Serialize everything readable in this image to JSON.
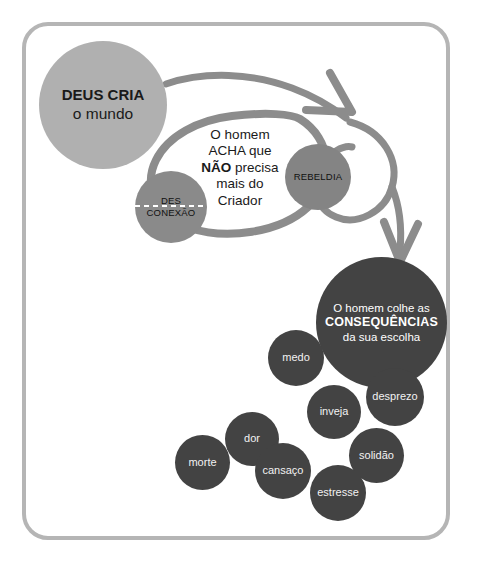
{
  "diagram": {
    "title_alt": "Ciclo: Deus cria o mundo, desconexao, rebeldia e consequencias",
    "frame_color": "#b5b5b5",
    "background": "#ffffff",
    "arrow_color": "#8c8c8c"
  },
  "nodes": {
    "deus": {
      "line1": "DEUS CRIA",
      "line2": "o mundo",
      "color": "#b0b0b0",
      "text_color": "#1a1a1a"
    },
    "desconexao": {
      "line1": "DES",
      "line2": "CONEXÃO",
      "color": "#8a8a8a",
      "text_color": "#111111"
    },
    "acha": {
      "line1": "O homem",
      "line2": "ACHA que",
      "line3_bold": "NÃO",
      "line3_rest": " precisa",
      "line4": "mais do",
      "line5": "Criador",
      "text_color": "#1a1a1a"
    },
    "rebeldia": {
      "label": "REBELDIA",
      "color": "#848484",
      "text_color": "#111111"
    },
    "consequencias": {
      "line1": "O homem colhe as",
      "line2_bold": "CONSEQUÊNCIAS",
      "line3": "da sua escolha",
      "color": "#434343",
      "text_color": "#ffffff"
    }
  },
  "consequence_items": [
    {
      "key": "medo",
      "label": "medo"
    },
    {
      "key": "desprezo",
      "label": "desprezo"
    },
    {
      "key": "inveja",
      "label": "inveja"
    },
    {
      "key": "dor",
      "label": "dor"
    },
    {
      "key": "solidao",
      "label": "solidão"
    },
    {
      "key": "morte",
      "label": "morte"
    },
    {
      "key": "cansaco",
      "label": "cansaço"
    },
    {
      "key": "estresse",
      "label": "estresse"
    }
  ]
}
